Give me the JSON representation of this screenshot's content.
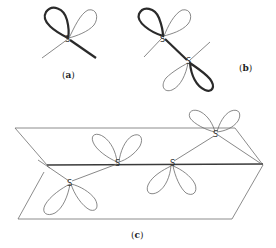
{
  "figure": {
    "panels": [
      {
        "id": "a",
        "label_open": "(",
        "label_letter": "a",
        "label_close": ")",
        "atoms": [
          "S"
        ]
      },
      {
        "id": "b",
        "label_open": "(",
        "label_letter": "b",
        "label_close": ")",
        "atoms": [
          "S",
          "S"
        ]
      },
      {
        "id": "c",
        "label_open": "(",
        "label_letter": "c",
        "label_close": ")",
        "atoms": [
          "S",
          "S",
          "S",
          "S"
        ]
      }
    ],
    "atom_symbol": "S",
    "colors": {
      "thin_line": "#6a6a6a",
      "thick_line": "#2a2a2a",
      "background": "#ffffff"
    }
  }
}
